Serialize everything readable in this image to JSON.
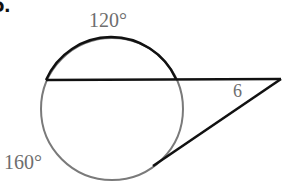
{
  "problem": {
    "number_label": "5."
  },
  "figure": {
    "type": "circle-with-secant-and-tangent",
    "circle": {
      "cx": 112,
      "cy": 109,
      "r": 71
    },
    "secant": {
      "x1": 46,
      "y1": 80,
      "x2": 281,
      "y2": 79
    },
    "tangent": {
      "x1": 281,
      "y1": 79,
      "x2": 153,
      "y2": 166
    },
    "colors": {
      "highlight_stroke": "#111111",
      "circle_stroke": "#7a7a7a",
      "label_text": "#6e6e6e"
    }
  },
  "labels": {
    "arc_top": "120°",
    "arc_bottom": "160°",
    "segment": "6"
  }
}
